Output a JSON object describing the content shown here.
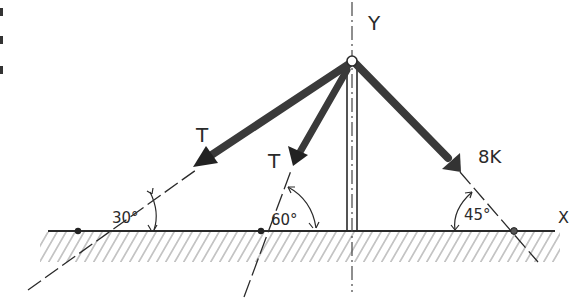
{
  "figure": {
    "type": "statics free-body sketch",
    "axes": {
      "x_label": "X",
      "y_label": "Y"
    },
    "forces": [
      {
        "id": "force-T-left",
        "label": "T",
        "angle_from_ground_deg": 30,
        "angle_label": "30°"
      },
      {
        "id": "force-T-middle",
        "label": "T",
        "angle_from_ground_deg": 60,
        "angle_label": "60°"
      },
      {
        "id": "force-8k",
        "label": "8K",
        "angle_from_ground_deg": 45,
        "angle_label": "45°"
      }
    ],
    "support": "vertical pole on hatched ground",
    "colors": {
      "ink": "#2a2a2a",
      "arrow_fill": "#3a3a3a",
      "hatch": "#8a8a8a",
      "background": "#ffffff"
    }
  }
}
